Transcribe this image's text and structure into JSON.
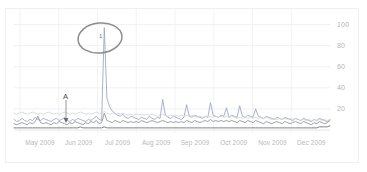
{
  "widget": {
    "name": "search-volume-trend-chart",
    "background_color": "#ffffff",
    "frame_color": "#efefef"
  },
  "chart_data": {
    "type": "line",
    "title": "",
    "subtitle": "",
    "xlabel": "",
    "ylabel": "",
    "grid": true,
    "legend_position": "none",
    "ylim": [
      0,
      110
    ],
    "yticks": [
      20,
      40,
      60,
      80,
      100
    ],
    "ytick_labels": [
      "20",
      "40",
      "60",
      "80",
      "100"
    ],
    "xtick_labels": [
      "May 2009",
      "Jun 2009",
      "Jul 2009",
      "Aug 2009",
      "Sep 2009",
      "Oct 2009",
      "Nov 2009",
      "Dec 2009"
    ],
    "x_range_start": "May 2009",
    "x_range_end": "Dec 2009",
    "annotations": [
      {
        "name": "news-marker-a",
        "label": "A",
        "x_position": "Jun 2009",
        "description": "news reference marker with pointer line"
      },
      {
        "name": "highlight-ellipse",
        "label": "1",
        "x_position": "late Jun 2009",
        "description": "hand drawn gray ellipse circling the tallest spike"
      }
    ],
    "series": [
      {
        "name": "series-1",
        "color": "#9aa4c4",
        "values": [
          10,
          8,
          9,
          11,
          9,
          8,
          10,
          9,
          12,
          10,
          9,
          11,
          10,
          9,
          8,
          10,
          11,
          9,
          10,
          12,
          9,
          8,
          10,
          9,
          11,
          10,
          9,
          8,
          10,
          9,
          11,
          13,
          10,
          9,
          97,
          30,
          22,
          18,
          16,
          14,
          13,
          15,
          12,
          11,
          13,
          12,
          11,
          10,
          12,
          11,
          10,
          13,
          11,
          10,
          12,
          11,
          29,
          14,
          12,
          11,
          13,
          12,
          11,
          10,
          12,
          24,
          13,
          12,
          14,
          13,
          12,
          11,
          13,
          12,
          26,
          14,
          13,
          12,
          14,
          13,
          21,
          12,
          14,
          13,
          12,
          23,
          13,
          12,
          14,
          13,
          12,
          20,
          13,
          12,
          11,
          13,
          12,
          11,
          10,
          12,
          11,
          10,
          12,
          11,
          10,
          9,
          11,
          10,
          9,
          11,
          10,
          9,
          8,
          10,
          9,
          11,
          10,
          9,
          8,
          10
        ]
      },
      {
        "name": "series-2",
        "color": "#8f8f8f",
        "values": [
          6,
          5,
          6,
          7,
          6,
          5,
          7,
          6,
          8,
          13,
          7,
          6,
          7,
          6,
          5,
          7,
          6,
          8,
          7,
          6,
          5,
          7,
          6,
          8,
          7,
          6,
          5,
          7,
          6,
          8,
          7,
          9,
          6,
          7,
          16,
          9,
          8,
          7,
          9,
          8,
          7,
          9,
          8,
          7,
          8,
          7,
          8,
          7,
          9,
          8,
          7,
          8,
          9,
          8,
          7,
          8,
          9,
          8,
          7,
          8,
          7,
          8,
          7,
          8,
          7,
          9,
          8,
          7,
          9,
          8,
          7,
          8,
          9,
          8,
          10,
          8,
          9,
          8,
          9,
          8,
          9,
          8,
          9,
          8,
          7,
          9,
          8,
          7,
          9,
          8,
          7,
          9,
          8,
          7,
          6,
          8,
          7,
          6,
          7,
          8,
          7,
          6,
          8,
          7,
          6,
          7,
          8,
          7,
          6,
          8,
          7,
          6,
          5,
          7,
          6,
          8,
          7,
          6,
          7,
          9
        ]
      },
      {
        "name": "series-3",
        "color": "#d6d6d6",
        "values": [
          16,
          15,
          16,
          17,
          16,
          15,
          16,
          17,
          16,
          15,
          16,
          15,
          16,
          17,
          16,
          15,
          16,
          15,
          16,
          17,
          16,
          15,
          16,
          15,
          16,
          17,
          16,
          15,
          16,
          15,
          16,
          17,
          16,
          15,
          18,
          16,
          15,
          16,
          15,
          16,
          15,
          16,
          15,
          14,
          15,
          14,
          15,
          14,
          15,
          14,
          15,
          14,
          15,
          14,
          13,
          14,
          15,
          14,
          13,
          14,
          13,
          14,
          13,
          14,
          13,
          14,
          13,
          14,
          13,
          12,
          13,
          12,
          13,
          12,
          13,
          12,
          13,
          12,
          13,
          12,
          13,
          12,
          13,
          12,
          11,
          12,
          11,
          12,
          11,
          12,
          11,
          12,
          11,
          12,
          11,
          12,
          11,
          10,
          11,
          10,
          11,
          10,
          11,
          10,
          11,
          10,
          11,
          10,
          9,
          10,
          9,
          10,
          9,
          10,
          9,
          10,
          9,
          10,
          9,
          10
        ]
      },
      {
        "name": "series-4",
        "color": "#6a6a7a",
        "values": [
          2,
          2,
          2,
          2,
          2,
          2,
          2,
          2,
          2,
          2,
          2,
          2,
          2,
          2,
          2,
          2,
          2,
          2,
          2,
          2,
          2,
          2,
          2,
          2,
          2,
          3,
          2,
          2,
          2,
          2,
          2,
          2,
          2,
          2,
          3,
          2,
          2,
          2,
          2,
          2,
          2,
          2,
          2,
          2,
          2,
          2,
          2,
          2,
          2,
          2,
          2,
          2,
          2,
          2,
          2,
          2,
          2,
          2,
          2,
          2,
          2,
          2,
          2,
          2,
          2,
          2,
          2,
          2,
          2,
          2,
          2,
          2,
          2,
          2,
          2,
          2,
          2,
          2,
          2,
          2,
          2,
          2,
          2,
          2,
          2,
          2,
          2,
          2,
          2,
          2,
          2,
          2,
          2,
          2,
          2,
          2,
          2,
          2,
          2,
          2,
          2,
          2,
          2,
          2,
          2,
          2,
          2,
          2,
          2,
          2,
          2,
          2,
          2,
          2,
          2,
          3,
          3,
          3,
          3,
          4
        ]
      }
    ]
  }
}
